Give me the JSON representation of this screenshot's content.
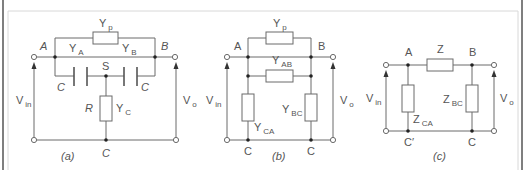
{
  "figure": {
    "colors": {
      "line": "#6a6a6a",
      "text": "#555555",
      "node": "#222222",
      "frame": "#d8d8d8",
      "edge": "#555555"
    },
    "panels": [
      {
        "id": "a",
        "caption": "(a)",
        "caption_pos": [
          61,
          160
        ],
        "wires": [
          [
            55,
            57,
            55,
            38
          ],
          [
            55,
            38,
            93,
            38
          ],
          [
            118,
            38,
            155,
            38
          ],
          [
            155,
            38,
            155,
            57
          ],
          [
            34,
            57,
            155,
            57
          ],
          [
            155,
            57,
            175,
            57
          ],
          [
            55,
            57,
            55,
            76
          ],
          [
            55,
            76,
            74,
            76
          ],
          [
            87,
            76,
            124,
            76
          ],
          [
            137,
            76,
            155,
            76
          ],
          [
            155,
            76,
            155,
            57
          ],
          [
            106,
            76,
            106,
            96
          ],
          [
            106,
            121,
            106,
            140
          ],
          [
            34,
            140,
            176,
            140
          ]
        ],
        "resistors": [
          {
            "x": 93,
            "y": 32,
            "w": 25,
            "h": 12,
            "name": "Yp-admittance"
          },
          {
            "x": 100,
            "y": 96,
            "w": 12,
            "h": 25,
            "name": "R-resistor"
          }
        ],
        "capacitors": [
          {
            "x1": 74,
            "x2": 87,
            "y1": 67,
            "y2": 86,
            "name": "left-capacitor"
          },
          {
            "x1": 124,
            "x2": 137,
            "y1": 67,
            "y2": 86,
            "name": "right-capacitor"
          }
        ],
        "nodes": [
          [
            55,
            57
          ],
          [
            155,
            57
          ],
          [
            106,
            76
          ],
          [
            106,
            140
          ]
        ],
        "terminals": [
          [
            34,
            57
          ],
          [
            175,
            57
          ],
          [
            34,
            140
          ],
          [
            176,
            140
          ]
        ],
        "arrows": [
          {
            "x": 34,
            "y_bottom": 140,
            "y_top": 62
          },
          {
            "x": 176,
            "y_bottom": 140,
            "y_top": 62
          }
        ],
        "labels": [
          {
            "text": "Y",
            "sub": "p",
            "x": 99,
            "y": 27,
            "italic": false
          },
          {
            "text": "A",
            "sub": "",
            "x": 40,
            "y": 50,
            "italic": true
          },
          {
            "text": "B",
            "sub": "",
            "x": 161,
            "y": 50,
            "italic": true
          },
          {
            "text": "Y",
            "sub": "A",
            "x": 69,
            "y": 52,
            "italic": false
          },
          {
            "text": "Y",
            "sub": "B",
            "x": 122,
            "y": 52,
            "italic": false
          },
          {
            "text": "S",
            "sub": "",
            "x": 102,
            "y": 70,
            "italic": false
          },
          {
            "text": "C",
            "sub": "",
            "x": 57,
            "y": 91,
            "italic": true
          },
          {
            "text": "C",
            "sub": "",
            "x": 141,
            "y": 91,
            "italic": true
          },
          {
            "text": "R",
            "sub": "",
            "x": 85,
            "y": 112,
            "italic": true
          },
          {
            "text": "Y",
            "sub": "C",
            "x": 116,
            "y": 112,
            "italic": false
          },
          {
            "text": "V",
            "sub": "in",
            "x": 16,
            "y": 104,
            "italic": false
          },
          {
            "text": "V",
            "sub": "o",
            "x": 183,
            "y": 104,
            "italic": false
          },
          {
            "text": "C",
            "sub": "",
            "x": 102,
            "y": 157,
            "italic": true
          }
        ]
      },
      {
        "id": "b",
        "caption": "(b)",
        "caption_pos": [
          272,
          160
        ],
        "wires": [
          [
            248,
            57,
            248,
            38
          ],
          [
            248,
            38,
            266,
            38
          ],
          [
            293,
            38,
            311,
            38
          ],
          [
            311,
            38,
            311,
            57
          ],
          [
            227,
            57,
            333,
            57
          ],
          [
            248,
            57,
            248,
            94
          ],
          [
            311,
            57,
            311,
            94
          ],
          [
            248,
            76,
            266,
            76
          ],
          [
            293,
            76,
            311,
            76
          ],
          [
            248,
            121,
            248,
            140
          ],
          [
            311,
            121,
            311,
            140
          ],
          [
            227,
            140,
            333,
            140
          ]
        ],
        "resistors": [
          {
            "x": 266,
            "y": 32,
            "w": 27,
            "h": 12,
            "name": "Yp-admittance"
          },
          {
            "x": 266,
            "y": 70,
            "w": 27,
            "h": 12,
            "name": "YAB-admittance"
          },
          {
            "x": 242,
            "y": 94,
            "w": 12,
            "h": 27,
            "name": "YCA-admittance"
          },
          {
            "x": 305,
            "y": 94,
            "w": 12,
            "h": 27,
            "name": "YBC-admittance"
          }
        ],
        "capacitors": [],
        "nodes": [
          [
            248,
            57
          ],
          [
            311,
            57
          ],
          [
            248,
            76
          ],
          [
            311,
            76
          ],
          [
            248,
            140
          ],
          [
            311,
            140
          ]
        ],
        "terminals": [
          [
            227,
            57
          ],
          [
            333,
            57
          ],
          [
            227,
            140
          ],
          [
            333,
            140
          ]
        ],
        "arrows": [
          {
            "x": 227,
            "y_bottom": 140,
            "y_top": 62
          },
          {
            "x": 333,
            "y_bottom": 140,
            "y_top": 62
          }
        ],
        "labels": [
          {
            "text": "Y",
            "sub": "p",
            "x": 273,
            "y": 27,
            "italic": false
          },
          {
            "text": "A",
            "sub": "",
            "x": 234,
            "y": 50,
            "italic": false
          },
          {
            "text": "B",
            "sub": "",
            "x": 318,
            "y": 50,
            "italic": false
          },
          {
            "text": "Y",
            "sub": "AB",
            "x": 272,
            "y": 64,
            "italic": false
          },
          {
            "text": "Y",
            "sub": "BC",
            "x": 282,
            "y": 113,
            "italic": false
          },
          {
            "text": "Y",
            "sub": "CA",
            "x": 254,
            "y": 131,
            "italic": false
          },
          {
            "text": "V",
            "sub": "in",
            "x": 206,
            "y": 104,
            "italic": false
          },
          {
            "text": "V",
            "sub": "o",
            "x": 340,
            "y": 104,
            "italic": false
          },
          {
            "text": "C",
            "sub": "",
            "x": 244,
            "y": 155,
            "italic": false
          },
          {
            "text": "C",
            "sub": "",
            "x": 307,
            "y": 155,
            "italic": false
          }
        ]
      },
      {
        "id": "c",
        "caption": "(c)",
        "caption_pos": [
          433,
          160
        ],
        "wires": [
          [
            386,
            65,
            427,
            65
          ],
          [
            453,
            65,
            494,
            65
          ],
          [
            408,
            65,
            408,
            85
          ],
          [
            472,
            65,
            472,
            85
          ],
          [
            408,
            112,
            408,
            131
          ],
          [
            472,
            112,
            472,
            131
          ],
          [
            386,
            131,
            494,
            131
          ]
        ],
        "resistors": [
          {
            "x": 427,
            "y": 59,
            "w": 26,
            "h": 12,
            "name": "Z-impedance"
          },
          {
            "x": 402,
            "y": 85,
            "w": 12,
            "h": 27,
            "name": "ZCA-impedance"
          },
          {
            "x": 466,
            "y": 85,
            "w": 12,
            "h": 27,
            "name": "ZBC-impedance"
          }
        ],
        "capacitors": [],
        "nodes": [
          [
            408,
            65
          ],
          [
            472,
            65
          ],
          [
            408,
            131
          ],
          [
            472,
            131
          ]
        ],
        "terminals": [
          [
            386,
            65
          ],
          [
            494,
            65
          ],
          [
            386,
            131
          ],
          [
            494,
            131
          ]
        ],
        "arrows": [
          {
            "x": 386,
            "y_bottom": 131,
            "y_top": 70
          },
          {
            "x": 494,
            "y_bottom": 131,
            "y_top": 70
          }
        ],
        "labels": [
          {
            "text": "A",
            "sub": "",
            "x": 405,
            "y": 56,
            "italic": false
          },
          {
            "text": "Z",
            "sub": "",
            "x": 437,
            "y": 53,
            "italic": false
          },
          {
            "text": "B",
            "sub": "",
            "x": 469,
            "y": 56,
            "italic": false
          },
          {
            "text": "Z",
            "sub": "BC",
            "x": 443,
            "y": 103,
            "italic": false
          },
          {
            "text": "Z",
            "sub": "CA",
            "x": 413,
            "y": 123,
            "italic": false
          },
          {
            "text": "V",
            "sub": "in",
            "x": 366,
            "y": 102,
            "italic": false
          },
          {
            "text": "V",
            "sub": "o",
            "x": 500,
            "y": 102,
            "italic": false
          },
          {
            "text": "C′",
            "sub": "",
            "x": 404,
            "y": 146,
            "italic": false
          },
          {
            "text": "C",
            "sub": "",
            "x": 468,
            "y": 146,
            "italic": false
          }
        ]
      }
    ]
  }
}
